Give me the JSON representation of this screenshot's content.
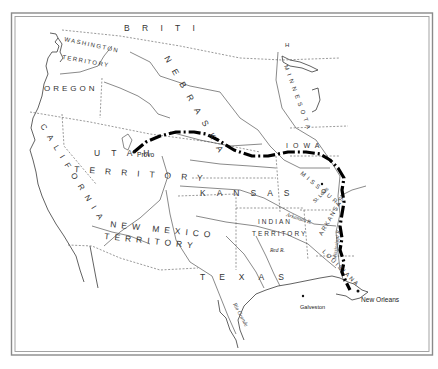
{
  "map": {
    "kind": "historical map of the western United States (territorial era)",
    "route": {
      "description": "bold dash-dot route line from Provo east across Nebraska & Iowa, then south along the Mississippi River to New Orleans",
      "color": "#000000"
    },
    "labels": {
      "british": [
        "B",
        "R",
        "I",
        "T",
        "I",
        "S",
        "H"
      ],
      "washington": "WASHINGTON",
      "territory_wa": "TERRITORY",
      "oregon": "OREGON",
      "california": "CALIFORNIA",
      "utah": "UTAH",
      "utah_territory": "TERRITORY",
      "nebraska": "NEBRASKA",
      "minnesota": "MINNESOTA",
      "iowa": "IOWA",
      "kansas": "KANSAS",
      "missouri": "MISSOURI",
      "arkansas": "ARKANSAS",
      "louisiana": "LOUISIANA",
      "new_mexico": "NEW MEXICO",
      "new_mexico_territory": "TERRITORY",
      "indian": "INDIAN",
      "indian_territory": "TERRITORY",
      "texas": "TEXAS"
    },
    "cities": {
      "provo": "Provo",
      "st_louis": "St. Louis",
      "galveston": "Galveston",
      "new_orleans": "New Orleans"
    },
    "rivers": {
      "arkansas": "Arkansas R.",
      "red": "Red R.",
      "rio_grande": "Rio Grande",
      "mississippi": "Mississippi R."
    }
  }
}
